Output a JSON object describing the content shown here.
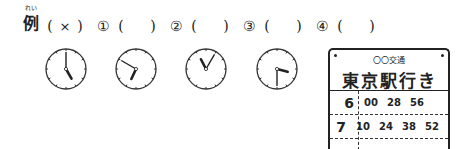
{
  "question": {
    "example": {
      "label": "例",
      "ruby": "れい",
      "answer": "×"
    },
    "items": [
      {
        "number": "①",
        "answer": ""
      },
      {
        "number": "②",
        "answer": ""
      },
      {
        "number": "③",
        "answer": ""
      },
      {
        "number": "④",
        "answer": ""
      }
    ],
    "open_paren": "(",
    "close_paren": ")"
  },
  "clocks": [
    {
      "id": "example",
      "hour": 5,
      "minute": 0
    },
    {
      "id": "1",
      "hour": 6,
      "minute": 50
    },
    {
      "id": "2",
      "hour": 11,
      "minute": 5
    },
    {
      "id": "3",
      "hour": 3,
      "minute": 30
    }
  ],
  "timetable": {
    "company": "〇〇交通",
    "destination": "東京駅行き",
    "rows": [
      {
        "hour": "6",
        "minutes": [
          "00",
          "28",
          "56"
        ]
      },
      {
        "hour": "7",
        "minutes": [
          "10",
          "24",
          "38",
          "52"
        ]
      }
    ]
  }
}
